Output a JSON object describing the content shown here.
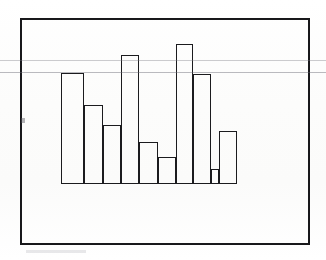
{
  "figure": {
    "caption": "Bar chart enclosed in a rectangular frame",
    "alt_text": "Scanned figure showing nine outlined vertical bars of varying height resting on a common baseline inside a thick rectangular border."
  },
  "colors": {
    "ink": "#1b1b1e",
    "frame": "#17171a",
    "paper": "#fdfdfc",
    "scan_artifact": "#787880"
  },
  "artifacts": {
    "scan_line_upper_label": "scanner streak upper",
    "scan_line_lower_label": "scanner streak lower",
    "edge_tick_label": "edge speck",
    "smudge_label": "bottom smudge"
  },
  "chart_data": {
    "type": "bar",
    "title": "",
    "subtitle": "",
    "xlabel": "",
    "ylabel": "",
    "grid": false,
    "legend": null,
    "axis_visible": false,
    "tick_labels_x": [],
    "tick_labels_y": [],
    "categories": [
      "1",
      "2",
      "3",
      "4",
      "5",
      "6",
      "7",
      "8",
      "9"
    ],
    "values": [
      111,
      79,
      59,
      129,
      42,
      27,
      140,
      110,
      53
    ],
    "ylim": [
      0,
      166
    ],
    "bar_style": "outline-only",
    "bars": [
      {
        "index": 1,
        "x": 61,
        "width": 23,
        "top": 73,
        "height": 111,
        "value": 111
      },
      {
        "index": 2,
        "x": 84,
        "width": 19,
        "top": 105,
        "height": 79,
        "value": 79
      },
      {
        "index": 3,
        "x": 103,
        "width": 18,
        "top": 125,
        "height": 59,
        "value": 59
      },
      {
        "index": 4,
        "x": 121,
        "width": 18,
        "top": 55,
        "height": 129,
        "value": 129
      },
      {
        "index": 5,
        "x": 139,
        "width": 19,
        "top": 142,
        "height": 42,
        "value": 42
      },
      {
        "index": 6,
        "x": 158,
        "width": 18,
        "top": 157,
        "height": 27,
        "value": 27
      },
      {
        "index": 7,
        "x": 176,
        "width": 17,
        "top": 44,
        "height": 140,
        "value": 140
      },
      {
        "index": 8,
        "x": 193,
        "width": 18,
        "top": 74,
        "height": 110,
        "value": 110
      },
      {
        "index": 9,
        "x": 219,
        "width": 18,
        "top": 131,
        "height": 53,
        "value": 53
      }
    ],
    "gap_bars": [
      {
        "index": 10,
        "x": 211,
        "width": 8,
        "top": 169,
        "height": 15,
        "value": 15,
        "note": "low step between bar 8 and bar 9"
      }
    ]
  }
}
